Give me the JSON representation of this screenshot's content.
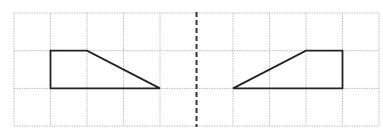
{
  "figure": {
    "grid": {
      "columns": 10,
      "rows": 3,
      "origin_px": [
        14,
        13
      ],
      "cell_w": 36.5,
      "cell_h": 37.7,
      "line_color": "#bdbdbd"
    },
    "axis_of_symmetry": {
      "column_index": 5,
      "style": "dashed",
      "color": "#333333"
    },
    "shapes": [
      {
        "name": "original-trapezoid",
        "grid_points": [
          [
            1,
            1
          ],
          [
            2,
            1
          ],
          [
            4,
            2
          ],
          [
            1,
            2
          ]
        ],
        "stroke": "#222222"
      },
      {
        "name": "reflected-trapezoid",
        "grid_points": [
          [
            6,
            2
          ],
          [
            8,
            1
          ],
          [
            9,
            1
          ],
          [
            9,
            2
          ]
        ],
        "stroke": "#222222"
      }
    ]
  }
}
